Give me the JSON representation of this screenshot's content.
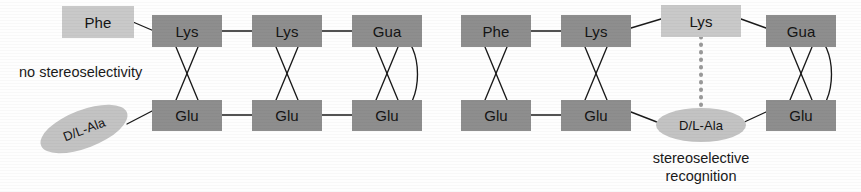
{
  "figure": {
    "type": "diagram"
  },
  "colors": {
    "box_dark": "#8e8e8e",
    "box_light": "#c9c9c9",
    "ellipse": "#c3c3c3",
    "line": "#1a1a1a",
    "text": "#141414",
    "background": "#ffffff"
  },
  "panels": [
    {
      "id": "left",
      "caption": "no stereoselectivity",
      "top_row": [
        {
          "label": "Phe",
          "shade": "light"
        },
        {
          "label": "Lys",
          "shade": "dark"
        },
        {
          "label": "Lys",
          "shade": "dark"
        },
        {
          "label": "Gua",
          "shade": "dark"
        }
      ],
      "bottom_row": [
        {
          "label": "D/L-Ala",
          "shade": "ellipse"
        },
        {
          "label": "Glu",
          "shade": "dark"
        },
        {
          "label": "Glu",
          "shade": "dark"
        },
        {
          "label": "Glu",
          "shade": "dark"
        }
      ]
    },
    {
      "id": "right",
      "caption_line1": "stereoselective",
      "caption_line2": "recognition",
      "top_row": [
        {
          "label": "Phe",
          "shade": "dark"
        },
        {
          "label": "Lys",
          "shade": "dark"
        },
        {
          "label": "Lys",
          "shade": "light"
        },
        {
          "label": "Gua",
          "shade": "dark"
        }
      ],
      "bottom_row": [
        {
          "label": "Glu",
          "shade": "dark"
        },
        {
          "label": "Glu",
          "shade": "dark"
        },
        {
          "label": "D/L-Ala",
          "shade": "ellipse"
        },
        {
          "label": "Glu",
          "shade": "dark"
        }
      ]
    }
  ],
  "nodes": {
    "l_phe": "Phe",
    "l_lys1": "Lys",
    "l_lys2": "Lys",
    "l_gua": "Gua",
    "l_ala": "D/L-Ala",
    "l_glu1": "Glu",
    "l_glu2": "Glu",
    "l_glu3": "Glu",
    "r_phe": "Phe",
    "r_lys1": "Lys",
    "r_lys2": "Lys",
    "r_gua": "Gua",
    "r_glu1": "Glu",
    "r_glu2": "Glu",
    "r_ala": "D/L-Ala",
    "r_glu3": "Glu"
  },
  "captions": {
    "left": "no stereoselectivity",
    "right_line1": "stereoselective",
    "right_line2": "recognition"
  }
}
